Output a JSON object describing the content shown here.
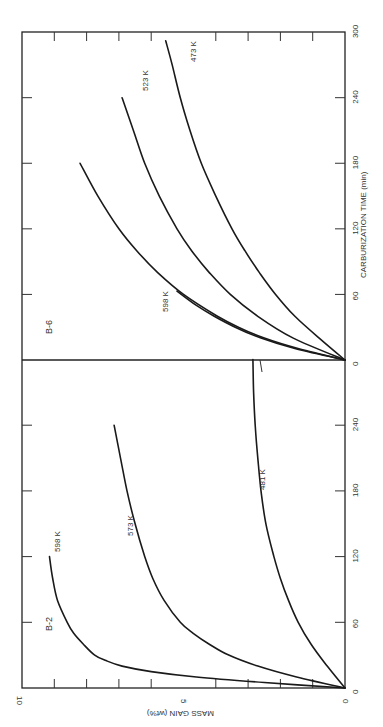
{
  "chart_data": [
    {
      "type": "line",
      "panel": "B-2",
      "title": "B-2",
      "xlabel": "CARBURIZATION TIME (min)",
      "ylabel": "MASS GAIN (wt%)",
      "xlim": [
        0,
        300
      ],
      "ylim": [
        0,
        10
      ],
      "x_ticks": [
        "0",
        "60",
        "120",
        "180",
        "240"
      ],
      "y_ticks": [
        "0",
        "5",
        "10"
      ],
      "grid": false,
      "series": [
        {
          "name": "598 K",
          "x": [
            0,
            5,
            10,
            15,
            20,
            25,
            30,
            40,
            50,
            60,
            80,
            100,
            120
          ],
          "values": [
            0,
            2.5,
            4.6,
            6.0,
            6.9,
            7.4,
            7.75,
            8.1,
            8.4,
            8.6,
            8.9,
            9.05,
            9.15
          ]
        },
        {
          "name": "573 K",
          "x": [
            0,
            10,
            20,
            30,
            40,
            50,
            60,
            80,
            100,
            120,
            150,
            180,
            210,
            240
          ],
          "values": [
            0,
            1.5,
            2.7,
            3.6,
            4.2,
            4.7,
            5.1,
            5.6,
            5.95,
            6.2,
            6.5,
            6.75,
            6.95,
            7.15
          ]
        },
        {
          "name": "481 K",
          "x": [
            0,
            20,
            40,
            60,
            80,
            100,
            120,
            150,
            180,
            210,
            240,
            270,
            300
          ],
          "values": [
            0,
            0.55,
            1.05,
            1.45,
            1.75,
            2.0,
            2.2,
            2.45,
            2.6,
            2.7,
            2.78,
            2.83,
            2.85
          ]
        }
      ]
    },
    {
      "type": "line",
      "panel": "B-6",
      "title": "B-6",
      "xlabel": "CARBURIZATION TIME (min)",
      "ylabel": "MASS GAIN (wt%)",
      "xlim": [
        0,
        300
      ],
      "ylim": [
        0,
        10
      ],
      "x_ticks": [
        "0",
        "60",
        "120",
        "180",
        "240",
        "300"
      ],
      "y_ticks": [],
      "grid": false,
      "series": [
        {
          "name": "598 K",
          "x": [
            0,
            10,
            20,
            30,
            40,
            50,
            63
          ],
          "values": [
            0,
            1.5,
            2.6,
            3.4,
            4.05,
            4.6,
            5.2
          ]
        },
        {
          "name": "unlabeled",
          "x": [
            0,
            10,
            20,
            30,
            40,
            60,
            80,
            100,
            120,
            150,
            180
          ],
          "values": [
            0,
            1.4,
            2.5,
            3.3,
            3.95,
            5.0,
            5.8,
            6.45,
            7.0,
            7.65,
            8.2
          ]
        },
        {
          "name": "523 K",
          "x": [
            0,
            20,
            40,
            60,
            80,
            100,
            120,
            150,
            180,
            210,
            240
          ],
          "values": [
            0,
            1.6,
            2.7,
            3.55,
            4.2,
            4.75,
            5.2,
            5.75,
            6.2,
            6.55,
            6.9
          ]
        },
        {
          "name": "473 K",
          "x": [
            0,
            20,
            40,
            60,
            80,
            100,
            120,
            150,
            180,
            210,
            240,
            270,
            292
          ],
          "values": [
            0,
            0.8,
            1.55,
            2.15,
            2.65,
            3.1,
            3.5,
            4.0,
            4.45,
            4.8,
            5.1,
            5.35,
            5.55
          ]
        }
      ]
    }
  ],
  "labels": {
    "panel_b2": "B-2",
    "panel_b6": "B-6",
    "xlabel": "CARBURIZATION TIME (min)",
    "ylabel": "MASS GAIN (wt%)",
    "b2_598": "598 K",
    "b2_573": "573 K",
    "b2_481": "481 K",
    "b6_598": "598 K",
    "b6_523": "523 K",
    "b6_473": "473 K",
    "mass_ticks": [
      "0",
      "5",
      "10"
    ],
    "b2_time_ticks": [
      "0",
      "60",
      "120",
      "180",
      "240"
    ],
    "b6_time_ticks": [
      "0",
      "60",
      "120",
      "180",
      "240",
      "300"
    ]
  }
}
